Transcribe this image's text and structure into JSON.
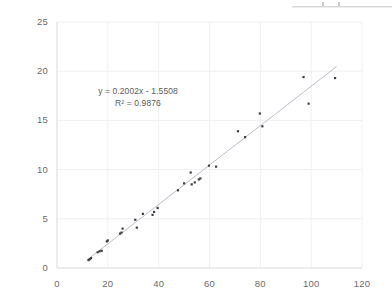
{
  "chart_data": {
    "type": "scatter",
    "title": "",
    "xlabel": "",
    "ylabel": "",
    "xlim": [
      0,
      120
    ],
    "ylim": [
      0,
      25
    ],
    "xticks": [
      0,
      20,
      40,
      60,
      80,
      100,
      120
    ],
    "yticks": [
      0,
      5,
      10,
      15,
      20,
      25
    ],
    "grid": true,
    "grid_color": "#f0f0f0",
    "legend": "none",
    "marker_color": "#3f3f3f",
    "trendline_color": "#b9bfc9",
    "annotations": {
      "equation": "y = 0.2002x - 1.5508",
      "r_squared": "R² = 0.9876"
    },
    "trendline": {
      "slope": 0.2002,
      "intercept": -1.5508,
      "r2": 0.9876,
      "x_start": 12.0,
      "x_end": 110.0
    },
    "points": [
      {
        "x": 12.4,
        "y": 0.8
      },
      {
        "x": 12.9,
        "y": 0.9
      },
      {
        "x": 13.4,
        "y": 1.0
      },
      {
        "x": 16.0,
        "y": 1.6
      },
      {
        "x": 16.8,
        "y": 1.7
      },
      {
        "x": 17.6,
        "y": 1.75
      },
      {
        "x": 19.6,
        "y": 2.7
      },
      {
        "x": 20.0,
        "y": 2.8
      },
      {
        "x": 24.8,
        "y": 3.5
      },
      {
        "x": 25.4,
        "y": 3.6
      },
      {
        "x": 25.8,
        "y": 4.0
      },
      {
        "x": 30.8,
        "y": 4.9
      },
      {
        "x": 31.4,
        "y": 4.1
      },
      {
        "x": 33.8,
        "y": 5.5
      },
      {
        "x": 37.6,
        "y": 5.4
      },
      {
        "x": 38.2,
        "y": 5.7
      },
      {
        "x": 39.6,
        "y": 6.1
      },
      {
        "x": 47.6,
        "y": 7.9
      },
      {
        "x": 50.0,
        "y": 8.6
      },
      {
        "x": 52.6,
        "y": 9.7
      },
      {
        "x": 53.0,
        "y": 8.5
      },
      {
        "x": 54.2,
        "y": 8.7
      },
      {
        "x": 55.8,
        "y": 9.0
      },
      {
        "x": 56.4,
        "y": 9.1
      },
      {
        "x": 59.8,
        "y": 10.4
      },
      {
        "x": 62.6,
        "y": 10.3
      },
      {
        "x": 71.2,
        "y": 13.9
      },
      {
        "x": 74.0,
        "y": 13.3
      },
      {
        "x": 79.8,
        "y": 15.7
      },
      {
        "x": 80.8,
        "y": 14.4
      },
      {
        "x": 97.0,
        "y": 19.4
      },
      {
        "x": 99.0,
        "y": 16.7
      },
      {
        "x": 109.4,
        "y": 19.3
      }
    ]
  }
}
